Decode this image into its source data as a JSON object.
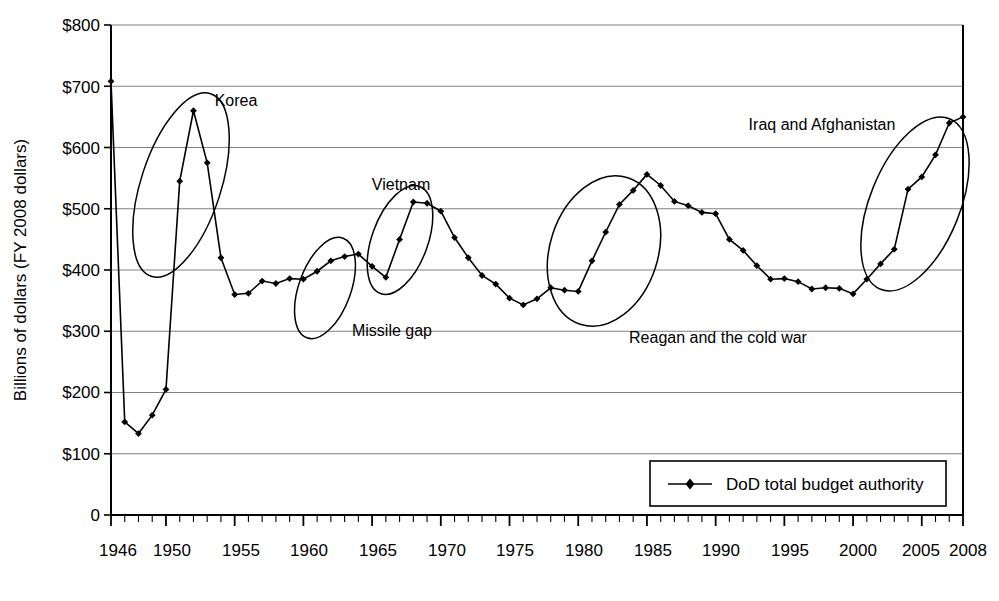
{
  "chart_data": {
    "type": "line",
    "title": "",
    "subtitle": "",
    "xlabel": "",
    "ylabel": "Billions of dollars (FY 2008 dollars)",
    "xlim": [
      1946,
      2008
    ],
    "ylim": [
      0,
      800
    ],
    "grid": "horizontal",
    "legend_position": "inside-bottom-right",
    "y_tick_labels": [
      "$800",
      "$700",
      "$600",
      "$500",
      "$400",
      "$300",
      "$200",
      "$100",
      "0"
    ],
    "y_tick_values": [
      800,
      700,
      600,
      500,
      400,
      300,
      200,
      100,
      0
    ],
    "x_tick_labels": [
      "1946",
      "1950",
      "1955",
      "1960",
      "1965",
      "1970",
      "1975",
      "1980",
      "1985",
      "1990",
      "1995",
      "2000",
      "2005",
      "2008"
    ],
    "x_tick_values": [
      1946,
      1950,
      1955,
      1960,
      1965,
      1970,
      1975,
      1980,
      1985,
      1990,
      1995,
      2000,
      2005,
      2008
    ],
    "x_minor_tick_step": 1,
    "series": [
      {
        "name": "DoD total budget authority",
        "marker": "diamond",
        "color": "#000000",
        "x": [
          1946,
          1947,
          1948,
          1949,
          1950,
          1951,
          1952,
          1953,
          1954,
          1955,
          1956,
          1957,
          1958,
          1959,
          1960,
          1961,
          1962,
          1963,
          1964,
          1965,
          1966,
          1967,
          1968,
          1969,
          1970,
          1971,
          1972,
          1973,
          1974,
          1975,
          1976,
          1977,
          1978,
          1979,
          1980,
          1981,
          1982,
          1983,
          1984,
          1985,
          1986,
          1987,
          1988,
          1989,
          1990,
          1991,
          1992,
          1993,
          1994,
          1995,
          1996,
          1997,
          1998,
          1999,
          2000,
          2001,
          2002,
          2003,
          2004,
          2005,
          2006,
          2007,
          2008
        ],
        "y": [
          708,
          152,
          133,
          163,
          205,
          545,
          660,
          575,
          420,
          360,
          362,
          382,
          378,
          386,
          385,
          398,
          415,
          422,
          426,
          406,
          388,
          450,
          511,
          509,
          496,
          453,
          420,
          391,
          377,
          354,
          343,
          353,
          371,
          367,
          365,
          415,
          462,
          507,
          530,
          556,
          538,
          512,
          505,
          494,
          492,
          450,
          432,
          407,
          385,
          386,
          381,
          369,
          371,
          370,
          361,
          385,
          410,
          434,
          532,
          552,
          588,
          640,
          650
        ]
      }
    ],
    "annotations": [
      {
        "label": "Korea",
        "highlight": "ellipse"
      },
      {
        "label": "Missile gap",
        "highlight": "ellipse"
      },
      {
        "label": "Vietnam",
        "highlight": "ellipse"
      },
      {
        "label": "Reagan and the cold war",
        "highlight": "ellipse"
      },
      {
        "label": "Iraq and Afghanistan",
        "highlight": "ellipse"
      }
    ]
  },
  "axes": {
    "y_title": "Billions of dollars (FY 2008 dollars)",
    "y_ticks": {
      "t800": "$800",
      "t700": "$700",
      "t600": "$600",
      "t500": "$500",
      "t400": "$400",
      "t300": "$300",
      "t200": "$200",
      "t100": "$100",
      "t0": "0"
    },
    "x_ticks": {
      "x1946": "1946",
      "x1950": "1950",
      "x1955": "1955",
      "x1960": "1960",
      "x1965": "1965",
      "x1970": "1970",
      "x1975": "1975",
      "x1980": "1980",
      "x1985": "1985",
      "x1990": "1990",
      "x1995": "1995",
      "x2000": "2000",
      "x2005": "2005",
      "x2008": "2008"
    }
  },
  "annotations": {
    "korea": "Korea",
    "missile_gap": "Missile gap",
    "vietnam": "Vietnam",
    "reagan": "Reagan and the cold war",
    "iraq_afghanistan": "Iraq and Afghanistan"
  },
  "legend": {
    "series_label": "DoD total budget authority"
  },
  "colors": {
    "line": "#000000",
    "marker": "#000000",
    "gridline": "#808080",
    "axis": "#000000",
    "background": "#ffffff"
  }
}
